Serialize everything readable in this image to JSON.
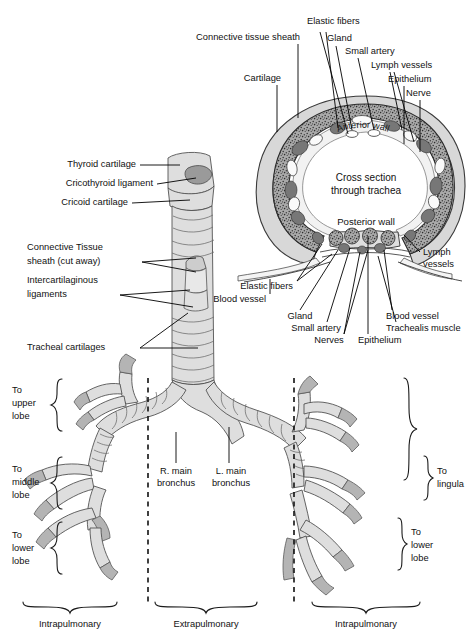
{
  "figure": {
    "background": "#ffffff",
    "line_color": "#111111"
  },
  "cross_section": {
    "center_line_1": "Cross section",
    "center_line_2": "through trachea",
    "anterior_wall": "Anterior wall",
    "posterior_wall": "Posterior wall",
    "labels_top": [
      {
        "text": "Connective tissue sheath"
      },
      {
        "text": "Elastic fibers"
      },
      {
        "text": "Gland"
      },
      {
        "text": "Small artery"
      },
      {
        "text": "Lymph vessels"
      },
      {
        "text": "Epithelium"
      },
      {
        "text": "Nerve"
      },
      {
        "text": "Cartilage"
      }
    ],
    "labels_bottom": [
      {
        "text": "Elastic fibers"
      },
      {
        "text": "Blood vessel"
      },
      {
        "text": "Gland"
      },
      {
        "text": "Small artery"
      },
      {
        "text": "Nerves"
      },
      {
        "text": "Epithelium"
      },
      {
        "text": "Blood vessel"
      },
      {
        "text": "Trachealis muscle"
      }
    ],
    "labels_right": [
      {
        "line1": "Lymph",
        "line2": "vessels"
      }
    ]
  },
  "trachea_labels": [
    {
      "text": "Thyroid cartilage"
    },
    {
      "text": "Cricothyroid ligament"
    },
    {
      "text": "Cricoid cartilage"
    },
    {
      "line1": "Connective Tissue",
      "line2": "sheath (cut away)"
    },
    {
      "line1": "Intercartilaginous",
      "line2": "ligaments"
    },
    {
      "text": "Tracheal cartilages"
    }
  ],
  "bronchi_labels": {
    "right_main": {
      "line1": "R. main",
      "line2": "bronchus"
    },
    "left_main": {
      "line1": "L. main",
      "line2": "bronchus"
    }
  },
  "lobes_left": [
    {
      "line1": "To",
      "line2": "upper",
      "line3": "lobe"
    },
    {
      "line1": "To",
      "line2": "middle",
      "line3": "lobe"
    },
    {
      "line1": "To",
      "line2": "lower",
      "line3": "lobe"
    }
  ],
  "lobes_right": [
    {
      "line1": "To",
      "line2": "lingula",
      "line3": ""
    },
    {
      "line1": "To",
      "line2": "lower",
      "line3": "lobe"
    }
  ],
  "bottom_axis": [
    {
      "text": "Intrapulmonary"
    },
    {
      "text": "Extrapulmonary"
    },
    {
      "text": "Intrapulmonary"
    }
  ]
}
